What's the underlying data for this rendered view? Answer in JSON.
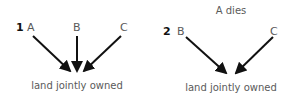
{
  "panels": [
    {
      "number": "1",
      "caption": "",
      "nodes": [
        "A",
        "B",
        "C"
      ],
      "target": "land jointly owned"
    },
    {
      "number": "2",
      "caption": "A dies",
      "nodes": [
        "B",
        "C"
      ],
      "target": "land jointly owned"
    }
  ],
  "colors": {
    "arrow": "#111111",
    "text": "#5a5a5a",
    "number": "#111111"
  }
}
